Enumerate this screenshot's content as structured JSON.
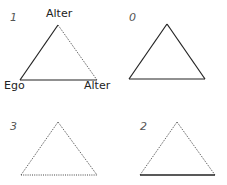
{
  "diagram": {
    "type": "triad-configurations",
    "line_color": "#222222",
    "panels": [
      {
        "id": "1",
        "label": "1",
        "vertices": {
          "top": "Alter",
          "bottom_left": "Ego",
          "bottom_right": "Alter"
        },
        "edges": {
          "left": "solid",
          "right": "dotted",
          "bottom": "solid"
        }
      },
      {
        "id": "0",
        "label": "0",
        "edges": {
          "left": "solid",
          "right": "solid",
          "bottom": "solid"
        }
      },
      {
        "id": "3",
        "label": "3",
        "edges": {
          "left": "dotted",
          "right": "dotted",
          "bottom": "dotted"
        }
      },
      {
        "id": "2",
        "label": "2",
        "edges": {
          "left": "dotted",
          "right": "dotted",
          "bottom": "solid"
        }
      }
    ]
  }
}
